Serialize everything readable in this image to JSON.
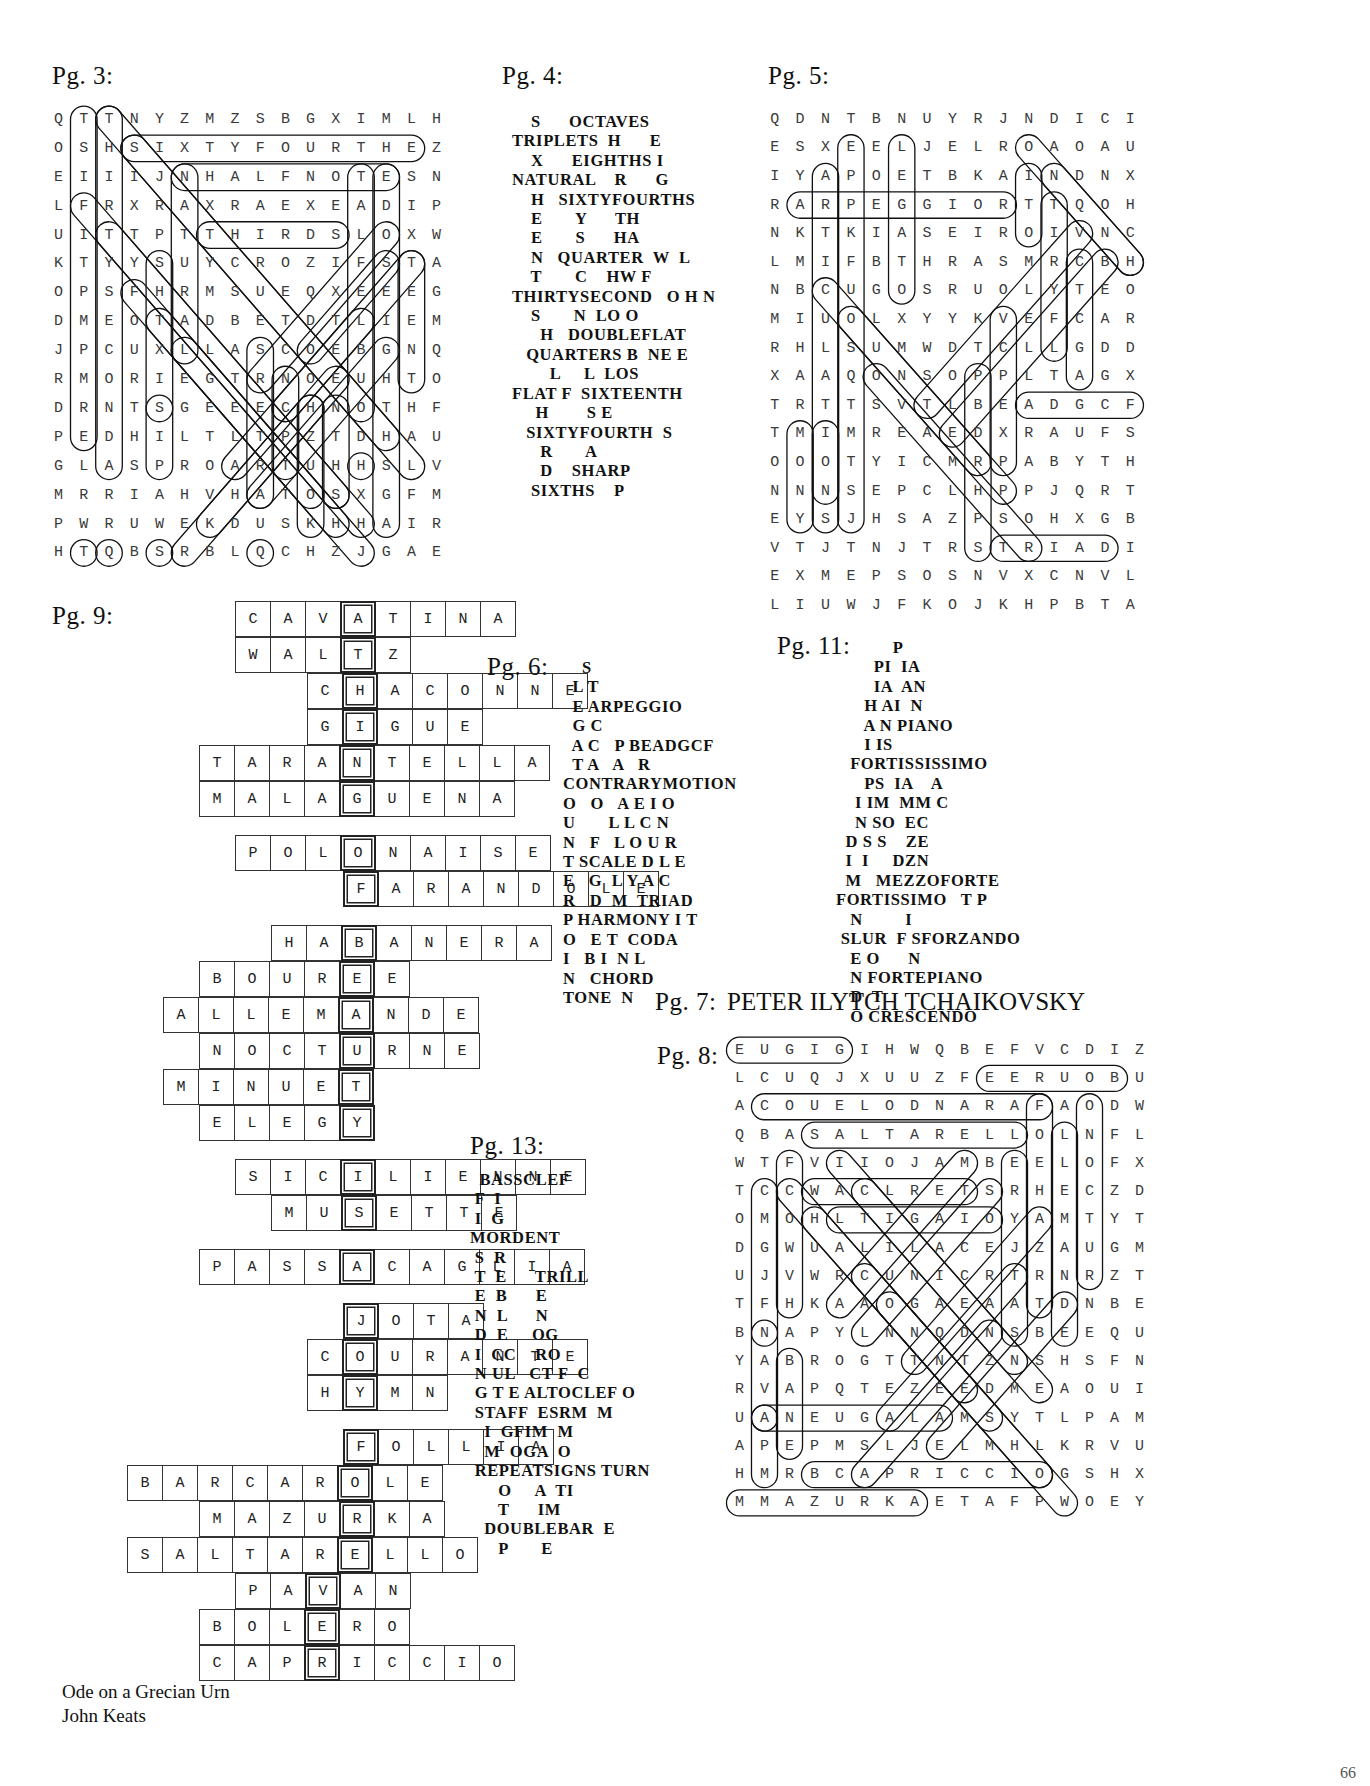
{
  "document": {
    "type": "puzzle-answer-key",
    "page_number": "66"
  },
  "labels": {
    "pg3": "Pg. 3:",
    "pg4": "Pg. 4:",
    "pg5": "Pg. 5:",
    "pg6": "Pg. 6:",
    "pg7": "Pg. 7:",
    "pg8": "Pg. 8:",
    "pg9": "Pg. 9:",
    "pg11": "Pg. 11:",
    "pg13": "Pg. 13:"
  },
  "pg3_wordsearch": {
    "rows": [
      "QTTNYZMZSBGXIMLH",
      "OSHSIXTYFOURTHEZ",
      "EIIIJNHALFNOTESN",
      "LFRXRAXRAEXEADIP",
      "UITTPTTHIRDSLOXW",
      "KTYYSUYCROZIFSTA",
      "OPSFHRMSUEQXEEEG",
      "DMEOTADBETDTLIEM",
      "JPCUXLLASCOEBGNQ",
      "RMORIEGTRNOEUHTO",
      "DRNTSGEEECHNOTHF",
      "PEDHILTLTPZTDHAU",
      "GLASPROARTUHHSLV",
      "MRRIAHVHATOSXGFM",
      "PWRUWEKDUSKHHAIR",
      "HTQBSRBLQCHZJGAE"
    ],
    "cols": 16,
    "rows_count": 16
  },
  "pg4_block": "     S      OCTAVES\n TRIPLETS  H      E\n     X      EIGHTHS  I\n NATURAL    R       G\n     H   SIXTYFOURTHS\n     E       Y      TH\n     E       S      HA\n     N   QUARTER  W  L\n     T       C    HWF\n THIRTYSECOND   O H N\n     S       NO  LOO\n       H   DOUBLEFLAT\n    QUARTERS B  NE E\n         L     L  LOS\n FLAT F  SIXTEENTH\n      H        SE\n    SIXTYFOURTH  S\n       R       A\n       D    SHARP\n     SIXTHS    P",
  "pg4_lines": [
    "    S      OCTAVES",
    "TRIPLETS  H      E",
    "    X      EIGHTHS I",
    "NATURAL    R      G",
    "    H   SIXTYFOURTHS",
    "    E       Y      TH",
    "    E       S      HA",
    "    N   QUARTER  W  L",
    "    T       C    HW F",
    "THIRTYSECOND   O H N",
    "    S       N  LO O",
    "      H   DOUBLEFLAT",
    "   QUARTERS B  NE E",
    "        L     L  LOS",
    "FLAT F  SIXTEENTH",
    "     H        S E",
    "   SIXTYFOURTH  S",
    "      R       A",
    "      D    SHARP",
    "    SIXTHS    P"
  ],
  "pg5_wordsearch": {
    "rows": [
      "QDNTBNUYRJNDICI",
      "ESXEELJELROAOAU",
      "IYAPOETBKAINDNX",
      "RARPEGGIORTTQOH",
      "NKTKIASEIROIVNC",
      "LMIFBTHRASMRCBH",
      "NBCUGOSRUOLYTEO",
      "MIUOLXYYKVEFCAR",
      "RHLSUMWDTCLLGDD",
      "XAAQONSOPPLTAGX",
      "TRTTSVTLBEADGCF",
      "TMIMREAEDXRAUFS",
      "OOOTYICMRPABYTH",
      "NNNSEPCLHPPJQRT",
      "EYSJHSAZPSOHXGB",
      "VTJTNJTRSTRIADI",
      "EXMEPSOSNVXCNVL",
      "LIUWJFKOJKHPBTA"
    ],
    "cols": 15,
    "rows_count": 18
  },
  "pg6_lines": [
    "    S",
    "  L T",
    "  E ARPEGGIO",
    "  G C",
    "  A C   P BEADGCF",
    "  T A   A   R",
    "CONTRARYMOTION",
    "O   O   A E I O",
    "U       L L C N",
    "N   F   L O U R",
    "T SCALE D L E",
    "E   G  L Y A C",
    "R   D  M  TRIAD",
    "P HARMONY I T",
    "O   E T  CODA",
    "I   B I  N L",
    "N   CHORD",
    "TONE  N"
  ],
  "pg11_lines": [
    "            P",
    "        PI  IA",
    "        IA  AN",
    "      H AI  N",
    "      A N PIANO",
    "      I IS",
    "   FORTISSISSIMO",
    "      PS  IA    A",
    "    I IM  MM C",
    "    N SO  EC",
    "  D S S    ZE",
    "  I  I     DZN",
    "  M   MEZZOFORTE",
    "FORTISSIMO   T P",
    "   N         I",
    " SLUR  F SFORZANDO",
    "   E O      N",
    "   N FORTEPIANO",
    "   D  T",
    "   O CRESCENDO"
  ],
  "pg7_answer": "PETER ILYTCH TCHAIKOVSKY",
  "pg13_lines": [
    "  BASSCLEF",
    " F  I",
    " I  G",
    "MORDENT",
    " S  R",
    " T  E      TRILL",
    " E  B      E",
    " N  L      N",
    " D  E     OG",
    " I  CC    RO",
    " N UL   CT F  C",
    " G T E ALTOCLEF O",
    " STAFF  ESRM  M",
    "   I  GFIM  M",
    "   M  OGA  O",
    " REPEATSIGNS TURN",
    "      O     A  TI",
    "      T      IM",
    "   DOUBLEBAR  E",
    "      P       E"
  ],
  "pg8_wordsearch": {
    "rows": [
      "EUGIGIHWQBEFVCDIZ",
      "LCUQJXUUZFEERUOBU",
      "ACOUELODNARAFAODW",
      "QBASALTARELLOLNFL",
      "WTFVIIOJAMBEELOFX",
      "TCCWACLRETSRHECZD",
      "OMOHLTIGAIOYAMTYT",
      "DGWUALILACEJZAUGM",
      "UJVWRCUNICRTRNRZT",
      "TFHKAAOGAEAATDNBE",
      "BNAPYLNNQDNSBEEQU",
      "YABROGTTNTZNSHSFN",
      "RVAPQTEZEEDMEAOUI",
      "UANEUGALAMSYTLPAM",
      "APEPMSLJELMHLKRVU",
      "HMRBCAPRICCIOGSHX",
      "MMAZURKAETAFPWOEY"
    ],
    "cols": 17,
    "rows_count": 17
  },
  "pg9_crossword": {
    "cell": 36,
    "rows": [
      {
        "start": 3,
        "y": 0,
        "cells": [
          {
            "l": "C"
          },
          {
            "l": "A"
          },
          {
            "l": "V"
          },
          {
            "l": "A",
            "key": true
          },
          {
            "l": "T"
          },
          {
            "l": "I"
          },
          {
            "l": "N"
          },
          {
            "l": "A"
          }
        ]
      },
      {
        "start": 3,
        "y": 1,
        "cells": [
          {
            "l": "W"
          },
          {
            "l": "A"
          },
          {
            "l": "L"
          },
          {
            "l": "T",
            "key": true
          },
          {
            "l": "Z"
          }
        ]
      },
      {
        "start": 5,
        "y": 2,
        "cells": [
          {
            "l": "C"
          },
          {
            "l": "H",
            "key": true
          },
          {
            "l": "A"
          },
          {
            "l": "C"
          },
          {
            "l": "O"
          },
          {
            "l": "N"
          },
          {
            "l": "N"
          },
          {
            "l": "E"
          }
        ]
      },
      {
        "start": 5,
        "y": 3,
        "cells": [
          {
            "l": "G"
          },
          {
            "l": "I",
            "key": true
          },
          {
            "l": "G"
          },
          {
            "l": "U"
          },
          {
            "l": "E"
          }
        ]
      },
      {
        "start": 2,
        "y": 4,
        "cells": [
          {
            "l": "T"
          },
          {
            "l": "A"
          },
          {
            "l": "R"
          },
          {
            "l": "A"
          },
          {
            "l": "N",
            "key": true
          },
          {
            "l": "T"
          },
          {
            "l": "E"
          },
          {
            "l": "L"
          },
          {
            "l": "L"
          },
          {
            "l": "A"
          }
        ]
      },
      {
        "start": 2,
        "y": 5,
        "cells": [
          {
            "l": "M"
          },
          {
            "l": "A"
          },
          {
            "l": "L"
          },
          {
            "l": "A"
          },
          {
            "l": "G",
            "key": true
          },
          {
            "l": "U"
          },
          {
            "l": "E"
          },
          {
            "l": "N"
          },
          {
            "l": "A"
          }
        ]
      },
      {
        "start": 3,
        "y": 6.5,
        "cells": [
          {
            "l": "P"
          },
          {
            "l": "O"
          },
          {
            "l": "L"
          },
          {
            "l": "O",
            "key": true
          },
          {
            "l": "N"
          },
          {
            "l": "A"
          },
          {
            "l": "I"
          },
          {
            "l": "S"
          },
          {
            "l": "E"
          }
        ]
      },
      {
        "start": 6,
        "y": 7.5,
        "cells": [
          {
            "l": "F",
            "key": true
          },
          {
            "l": "A"
          },
          {
            "l": "R"
          },
          {
            "l": "A"
          },
          {
            "l": "N"
          },
          {
            "l": "D"
          },
          {
            "l": "O"
          },
          {
            "l": "L"
          },
          {
            "l": "E"
          }
        ]
      },
      {
        "start": 4,
        "y": 9,
        "cells": [
          {
            "l": "H"
          },
          {
            "l": "A"
          },
          {
            "l": "B",
            "key": true
          },
          {
            "l": "A"
          },
          {
            "l": "N"
          },
          {
            "l": "E"
          },
          {
            "l": "R"
          },
          {
            "l": "A"
          }
        ]
      },
      {
        "start": 2,
        "y": 10,
        "cells": [
          {
            "l": "B"
          },
          {
            "l": "O"
          },
          {
            "l": "U"
          },
          {
            "l": "R"
          },
          {
            "l": "E",
            "key": true
          },
          {
            "l": "E"
          }
        ]
      },
      {
        "start": 1,
        "y": 11,
        "cells": [
          {
            "l": "A"
          },
          {
            "l": "L"
          },
          {
            "l": "L"
          },
          {
            "l": "E"
          },
          {
            "l": "M"
          },
          {
            "l": "A",
            "key": true
          },
          {
            "l": "N"
          },
          {
            "l": "D"
          },
          {
            "l": "E"
          }
        ]
      },
      {
        "start": 2,
        "y": 12,
        "cells": [
          {
            "l": "N"
          },
          {
            "l": "O"
          },
          {
            "l": "C"
          },
          {
            "l": "T"
          },
          {
            "l": "U",
            "key": true
          },
          {
            "l": "R"
          },
          {
            "l": "N"
          },
          {
            "l": "E"
          }
        ]
      },
      {
        "start": 1,
        "y": 13,
        "cells": [
          {
            "l": "M"
          },
          {
            "l": "I"
          },
          {
            "l": "N"
          },
          {
            "l": "U"
          },
          {
            "l": "E"
          },
          {
            "l": "T",
            "key": true
          }
        ]
      },
      {
        "start": 2,
        "y": 14,
        "cells": [
          {
            "l": "E"
          },
          {
            "l": "L"
          },
          {
            "l": "E"
          },
          {
            "l": "G"
          },
          {
            "l": "Y",
            "key": true
          }
        ]
      },
      {
        "start": 3,
        "y": 15.5,
        "cells": [
          {
            "l": "S"
          },
          {
            "l": "I"
          },
          {
            "l": "C"
          },
          {
            "l": "I",
            "key": true
          },
          {
            "l": "L"
          },
          {
            "l": "I"
          },
          {
            "l": "E"
          },
          {
            "l": "N"
          },
          {
            "l": "N"
          },
          {
            "l": "E"
          }
        ]
      },
      {
        "start": 4,
        "y": 16.5,
        "cells": [
          {
            "l": "M"
          },
          {
            "l": "U"
          },
          {
            "l": "S",
            "key": true
          },
          {
            "l": "E"
          },
          {
            "l": "T"
          },
          {
            "l": "T"
          },
          {
            "l": "E"
          }
        ]
      },
      {
        "start": 2,
        "y": 18,
        "cells": [
          {
            "l": "P"
          },
          {
            "l": "A"
          },
          {
            "l": "S"
          },
          {
            "l": "S"
          },
          {
            "l": "A",
            "key": true
          },
          {
            "l": "C"
          },
          {
            "l": "A"
          },
          {
            "l": "G"
          },
          {
            "l": "L"
          },
          {
            "l": "I"
          },
          {
            "l": "A"
          }
        ]
      },
      {
        "start": 6,
        "y": 19.5,
        "cells": [
          {
            "l": "J",
            "key": true
          },
          {
            "l": "O"
          },
          {
            "l": "T"
          },
          {
            "l": "A"
          }
        ]
      },
      {
        "start": 5,
        "y": 20.5,
        "cells": [
          {
            "l": "C"
          },
          {
            "l": "O",
            "key": true
          },
          {
            "l": "U"
          },
          {
            "l": "R"
          },
          {
            "l": "A"
          },
          {
            "l": "N"
          },
          {
            "l": "T"
          },
          {
            "l": "E"
          }
        ]
      },
      {
        "start": 5,
        "y": 21.5,
        "cells": [
          {
            "l": "H"
          },
          {
            "l": "Y",
            "key": true
          },
          {
            "l": "M"
          },
          {
            "l": "N"
          }
        ]
      },
      {
        "start": 6,
        "y": 23,
        "cells": [
          {
            "l": "F",
            "key": true
          },
          {
            "l": "O"
          },
          {
            "l": "L"
          },
          {
            "l": "L"
          },
          {
            "l": "I"
          },
          {
            "l": "A"
          }
        ]
      },
      {
        "start": 0,
        "y": 24,
        "cells": [
          {
            "l": "B"
          },
          {
            "l": "A"
          },
          {
            "l": "R"
          },
          {
            "l": "C"
          },
          {
            "l": "A"
          },
          {
            "l": "R"
          },
          {
            "l": "O",
            "key": true
          },
          {
            "l": "L"
          },
          {
            "l": "E"
          }
        ]
      },
      {
        "start": 2,
        "y": 25,
        "cells": [
          {
            "l": "M"
          },
          {
            "l": "A"
          },
          {
            "l": "Z"
          },
          {
            "l": "U"
          },
          {
            "l": "R",
            "key": true
          },
          {
            "l": "K"
          },
          {
            "l": "A"
          }
        ]
      },
      {
        "start": 0,
        "y": 26,
        "cells": [
          {
            "l": "S"
          },
          {
            "l": "A"
          },
          {
            "l": "L"
          },
          {
            "l": "T"
          },
          {
            "l": "A"
          },
          {
            "l": "R"
          },
          {
            "l": "E",
            "key": true
          },
          {
            "l": "L"
          },
          {
            "l": "L"
          },
          {
            "l": "O"
          }
        ]
      },
      {
        "start": 3,
        "y": 27,
        "cells": [
          {
            "l": "P"
          },
          {
            "l": "A"
          },
          {
            "l": "V",
            "key": true
          },
          {
            "l": "A"
          },
          {
            "l": "N"
          }
        ]
      },
      {
        "start": 2,
        "y": 28,
        "cells": [
          {
            "l": "B"
          },
          {
            "l": "O"
          },
          {
            "l": "L"
          },
          {
            "l": "E",
            "key": true
          },
          {
            "l": "R"
          },
          {
            "l": "O"
          }
        ]
      },
      {
        "start": 2,
        "y": 29,
        "cells": [
          {
            "l": "C"
          },
          {
            "l": "A"
          },
          {
            "l": "P"
          },
          {
            "l": "R",
            "key": true
          },
          {
            "l": "I"
          },
          {
            "l": "C"
          },
          {
            "l": "C"
          },
          {
            "l": "I"
          },
          {
            "l": "O"
          }
        ]
      }
    ]
  },
  "credit": "Ode on a Grecian Urn\nJohn Keats"
}
